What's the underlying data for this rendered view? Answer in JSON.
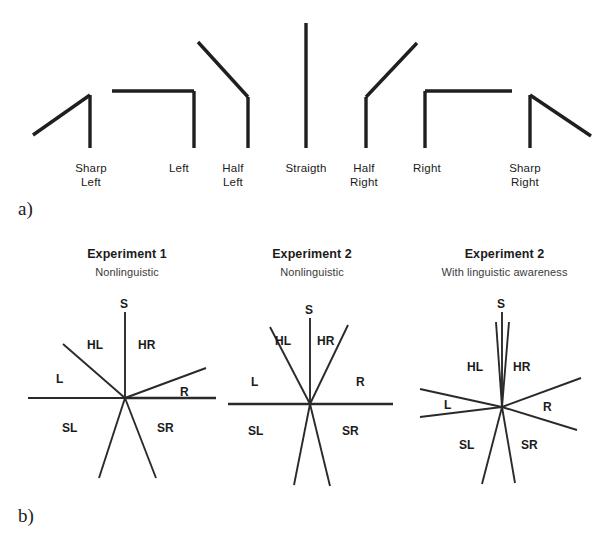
{
  "figure": {
    "panel_a": {
      "letter": "a)",
      "shapes": [
        {
          "name": "sharp-left",
          "label": "Sharp\nLeft",
          "label_x": 62,
          "label_y": 162,
          "stem": [
            90,
            95,
            90,
            148
          ],
          "arm": [
            90,
            95,
            33,
            135
          ],
          "label_w": 58
        },
        {
          "name": "left",
          "label": "Left",
          "label_x": 150,
          "label_y": 162,
          "stem": [
            194,
            91,
            194,
            148
          ],
          "arm": [
            194,
            91,
            112,
            91
          ],
          "label_w": 58
        },
        {
          "name": "half-left",
          "label": "Half\nLeft",
          "label_x": 204,
          "label_y": 162,
          "stem": [
            248,
            97,
            248,
            148
          ],
          "arm": [
            248,
            97,
            198,
            42
          ],
          "label_w": 58
        },
        {
          "name": "straight",
          "label": "Straigth",
          "label_x": 272,
          "label_y": 162,
          "stem": [
            306,
            23,
            306,
            148
          ],
          "arm": null,
          "label_w": 68
        },
        {
          "name": "half-right",
          "label": "Half\nRight",
          "label_x": 335,
          "label_y": 162,
          "stem": [
            366,
            97,
            366,
            148
          ],
          "arm": [
            366,
            97,
            417,
            43
          ],
          "label_w": 58
        },
        {
          "name": "right",
          "label": "Right",
          "label_x": 398,
          "label_y": 162,
          "stem": [
            425,
            91,
            425,
            148
          ],
          "arm": [
            425,
            91,
            512,
            91
          ],
          "label_w": 58
        },
        {
          "name": "sharp-right",
          "label": "Sharp\nRight",
          "label_x": 494,
          "label_y": 162,
          "stem": [
            530,
            95,
            530,
            148
          ],
          "arm": [
            530,
            95,
            591,
            136
          ],
          "label_w": 62
        }
      ]
    },
    "panel_b": {
      "letter": "b)",
      "diagrams": [
        {
          "name": "experiment-1-nonlinguistic",
          "title": "Experiment 1",
          "subtitle": "Nonlinguistic",
          "center": [
            125,
            398
          ],
          "rays": [
            {
              "name": "S",
              "to": [
                125,
                312
              ]
            },
            {
              "name": "HL",
              "to": [
                63,
                344
              ]
            },
            {
              "name": "L",
              "to": [
                28,
                398
              ]
            },
            {
              "name": "SL",
              "to": [
                99,
                478
              ]
            },
            {
              "name": "SR",
              "to": [
                156,
                478
              ]
            },
            {
              "name": "R",
              "to": [
                206,
                368
              ]
            },
            {
              "name": "axis-right",
              "to": [
                216,
                398
              ]
            }
          ],
          "labels": [
            {
              "name": "S",
              "text": "S",
              "x": 120,
              "y": 297
            },
            {
              "name": "HL",
              "text": "HL",
              "x": 87,
              "y": 338
            },
            {
              "name": "HR",
              "text": "HR",
              "x": 138,
              "y": 338
            },
            {
              "name": "L",
              "text": "L",
              "x": 56,
              "y": 372
            },
            {
              "name": "R",
              "text": "R",
              "x": 180,
              "y": 385
            },
            {
              "name": "SL",
              "text": "SL",
              "x": 62,
              "y": 421
            },
            {
              "name": "SR",
              "text": "SR",
              "x": 157,
              "y": 421
            }
          ]
        },
        {
          "name": "experiment-2-nonlinguistic",
          "title": "Experiment 2",
          "subtitle": "Nonlinguistic",
          "center": [
            310,
            404
          ],
          "rays": [
            {
              "name": "S",
              "to": [
                310,
                318
              ]
            },
            {
              "name": "HL",
              "to": [
                270,
                327
              ]
            },
            {
              "name": "HR",
              "to": [
                348,
                325
              ]
            },
            {
              "name": "SL",
              "to": [
                294,
                485
              ]
            },
            {
              "name": "SR",
              "to": [
                330,
                486
              ]
            },
            {
              "name": "axis-left",
              "to": [
                228,
                404
              ]
            },
            {
              "name": "axis-right",
              "to": [
                393,
                404
              ]
            }
          ],
          "labels": [
            {
              "name": "S",
              "text": "S",
              "x": 305,
              "y": 303
            },
            {
              "name": "HL",
              "text": "HL",
              "x": 275,
              "y": 334
            },
            {
              "name": "HR",
              "text": "HR",
              "x": 317,
              "y": 334
            },
            {
              "name": "L",
              "text": "L",
              "x": 251,
              "y": 375
            },
            {
              "name": "R",
              "text": "R",
              "x": 356,
              "y": 375
            },
            {
              "name": "SL",
              "text": "SL",
              "x": 248,
              "y": 424
            },
            {
              "name": "SR",
              "text": "SR",
              "x": 342,
              "y": 424
            }
          ]
        },
        {
          "name": "experiment-2-with-linguistic-awareness",
          "title": "Experiment 2",
          "subtitle": "With linguistic awareness",
          "center": [
            502,
            407
          ],
          "rays": [
            {
              "name": "S",
              "to": [
                502,
                312
              ]
            },
            {
              "name": "HL",
              "to": [
                496,
                322
              ]
            },
            {
              "name": "HR",
              "to": [
                509,
                322
              ]
            },
            {
              "name": "L-upper",
              "to": [
                420,
                389
              ]
            },
            {
              "name": "L-lower",
              "to": [
                420,
                417
              ]
            },
            {
              "name": "R",
              "to": [
                581,
                378
              ]
            },
            {
              "name": "R-lower",
              "to": [
                577,
                430
              ]
            },
            {
              "name": "SL",
              "to": [
                482,
                484
              ]
            },
            {
              "name": "SR",
              "to": [
                515,
                483
              ]
            }
          ],
          "labels": [
            {
              "name": "S",
              "text": "S",
              "x": 497,
              "y": 297
            },
            {
              "name": "HL",
              "text": "HL",
              "x": 467,
              "y": 360
            },
            {
              "name": "HR",
              "text": "HR",
              "x": 513,
              "y": 360
            },
            {
              "name": "L",
              "text": "L",
              "x": 444,
              "y": 398
            },
            {
              "name": "R",
              "text": "R",
              "x": 543,
              "y": 400
            },
            {
              "name": "SL",
              "text": "SL",
              "x": 459,
              "y": 438
            },
            {
              "name": "SR",
              "text": "SR",
              "x": 521,
              "y": 438
            }
          ]
        }
      ]
    }
  },
  "colors": {
    "ink": "#1f1f1f",
    "ray": "#2a2a2a",
    "background": "#ffffff",
    "subtitle": "#3a3a3a"
  }
}
